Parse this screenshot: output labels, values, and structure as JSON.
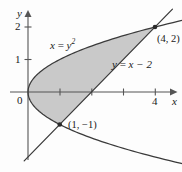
{
  "figure": {
    "colors": {
      "shade": "#c9c9c9",
      "stroke": "#3a3a3a",
      "axis": "#555555",
      "text": "#1a1a1a"
    }
  },
  "axes": {
    "x_label": "x",
    "y_label": "y",
    "origin_label": "0",
    "x_ticks": [
      {
        "value": 1,
        "label": ""
      },
      {
        "value": 2,
        "label": ""
      },
      {
        "value": 3,
        "label": ""
      },
      {
        "value": 4,
        "label": "4"
      }
    ],
    "y_ticks": [
      {
        "value": 1,
        "label": "1"
      },
      {
        "value": 2,
        "label": "2"
      }
    ],
    "x_range": [
      -0.1,
      4.85
    ],
    "y_range": [
      -2.45,
      2.6
    ]
  },
  "curves": [
    {
      "name": "parabola",
      "label_lhs": "x",
      "label_eq": " = ",
      "label_rhs": "y",
      "label_exp": "2",
      "equation_text": "x = y²"
    },
    {
      "name": "line",
      "equation_text": "y = x − 2",
      "label_lhs": "y",
      "label_eq": " = ",
      "label_rhs": "x − 2"
    }
  ],
  "points": [
    {
      "name": "upper-intersection",
      "label": "(4, 2)",
      "x": 4,
      "y": 2
    },
    {
      "name": "lower-intersection",
      "label": "(1, −1)",
      "x": 1,
      "y": -1
    }
  ],
  "region": {
    "name": "shaded-region",
    "description": "Area between x = y² and y = x − 2 from y = −1 to y = 2"
  }
}
